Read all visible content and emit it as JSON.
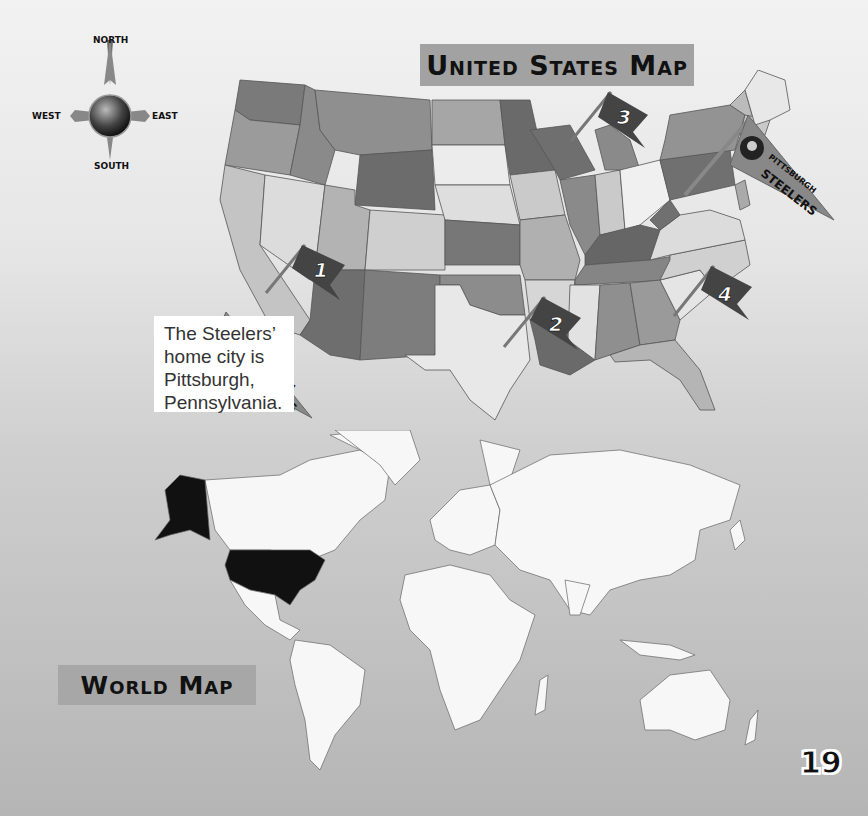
{
  "page": {
    "number": "19",
    "background_gradient": [
      "#f2f2f2",
      "#b5b5b5"
    ]
  },
  "compass": {
    "north": "NORTH",
    "south": "SOUTH",
    "east": "EAST",
    "west": "WEST"
  },
  "us_map": {
    "title": "United States Map",
    "title_bg": "#a2a2a2",
    "markers": [
      {
        "id": 1,
        "label": "1",
        "location": "Arizona"
      },
      {
        "id": 2,
        "label": "2",
        "location": "Louisiana"
      },
      {
        "id": 3,
        "label": "3",
        "location": "Wisconsin"
      },
      {
        "id": 4,
        "label": "4",
        "location": "North Carolina"
      }
    ],
    "pennant": {
      "line1": "PITTSBURGH",
      "line2": "STEELERS",
      "location": "Pennsylvania"
    }
  },
  "callout": {
    "text_lines": [
      "The Steelers’",
      "home city is",
      "Pittsburgh,",
      "Pennsylvania."
    ]
  },
  "callout_pennant": {
    "line1": "PITTSBURGH",
    "line2": "STEELERS"
  },
  "world_map": {
    "title": "World Map",
    "title_bg": "#a7a7a7",
    "highlighted_country": "United States",
    "highlight_color": "#111111",
    "land_color": "#f7f7f7",
    "water_color": "#b9b9b9",
    "markers": [
      {
        "id": 5,
        "label": "5",
        "location": "Russia / Europe"
      }
    ]
  }
}
